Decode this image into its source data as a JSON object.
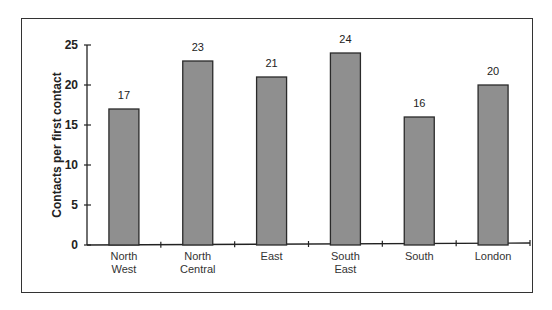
{
  "chart_data": {
    "type": "bar",
    "title": "",
    "xlabel": "",
    "ylabel": "Contacts per first contact",
    "categories": [
      "North West",
      "North Central",
      "East",
      "South East",
      "South",
      "London"
    ],
    "category_lines": [
      [
        "North",
        "West"
      ],
      [
        "North",
        "Central"
      ],
      [
        "East"
      ],
      [
        "South",
        "East"
      ],
      [
        "South"
      ],
      [
        "London"
      ]
    ],
    "values": [
      17,
      23,
      21,
      24,
      16,
      20
    ],
    "data_labels": [
      "17",
      "23",
      "21",
      "24",
      "16",
      "20"
    ],
    "ylim": [
      0,
      25
    ],
    "yticks": [
      0,
      5,
      10,
      15,
      20,
      25
    ],
    "grid": false,
    "legend": null,
    "bar_color": "#8f8f8f",
    "bar_edge_color": "#2a2a2a"
  }
}
